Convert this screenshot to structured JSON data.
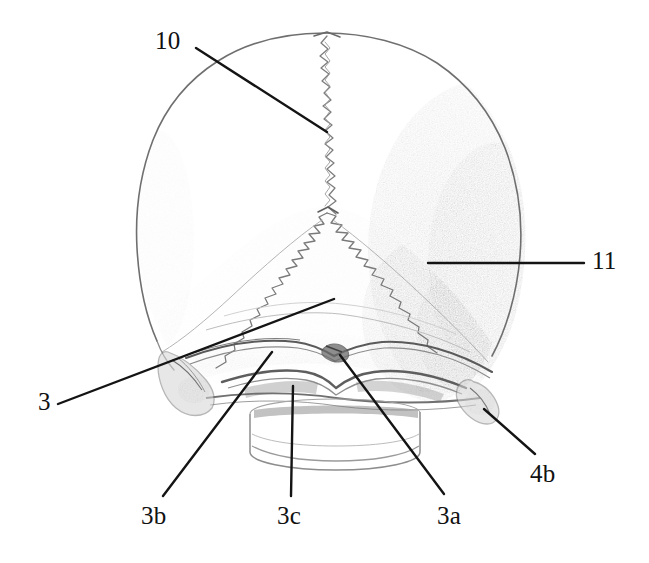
{
  "figure": {
    "medium": "pencil drawing",
    "background_color": "#ffffff",
    "ink_color": "#1a1a1a",
    "pencil_color": "#8a8a8a",
    "view": "posterior"
  },
  "labels": [
    {
      "id": "10",
      "text": "10",
      "structure": "sagittal suture",
      "text_x": 155,
      "text_y": 28,
      "leader": {
        "x1": 196,
        "y1": 48,
        "x2": 327,
        "y2": 132
      }
    },
    {
      "id": "11",
      "text": "11",
      "structure": "lambdoid suture",
      "text_x": 592,
      "text_y": 248,
      "leader": {
        "x1": 584,
        "y1": 263,
        "x2": 428,
        "y2": 263
      }
    },
    {
      "id": "3",
      "text": "3",
      "structure": "occipital bone",
      "text_x": 38,
      "text_y": 389,
      "leader": {
        "x1": 58,
        "y1": 404,
        "x2": 334,
        "y2": 299
      }
    },
    {
      "id": "3b",
      "text": "3b",
      "structure": "superior nuchal line",
      "text_x": 141,
      "text_y": 503,
      "leader": {
        "x1": 163,
        "y1": 496,
        "x2": 272,
        "y2": 352
      }
    },
    {
      "id": "3c",
      "text": "3c",
      "structure": "inferior nuchal line",
      "text_x": 277,
      "text_y": 503,
      "leader": {
        "x1": 291,
        "y1": 496,
        "x2": 293,
        "y2": 386
      }
    },
    {
      "id": "3a",
      "text": "3a",
      "structure": "external occipital protuberance",
      "text_x": 437,
      "text_y": 503,
      "leader": {
        "x1": 444,
        "y1": 494,
        "x2": 340,
        "y2": 355
      }
    },
    {
      "id": "4b",
      "text": "4b",
      "structure": "mastoid process",
      "text_x": 530,
      "text_y": 461,
      "leader": {
        "x1": 535,
        "y1": 454,
        "x2": 484,
        "y2": 409
      }
    }
  ],
  "structures": [
    {
      "key": "cranial-vault",
      "name": "cranial vault outline"
    },
    {
      "key": "sagittal-suture",
      "name": "sagittal suture"
    },
    {
      "key": "lambdoid-suture",
      "name": "lambdoid suture"
    },
    {
      "key": "occipital-bone",
      "name": "occipital squama"
    },
    {
      "key": "superior-nuchal-line",
      "name": "superior nuchal line"
    },
    {
      "key": "inferior-nuchal-line",
      "name": "inferior nuchal line"
    },
    {
      "key": "external-occipital-protuberance",
      "name": "external occipital protuberance"
    },
    {
      "key": "mastoid-process-left",
      "name": "left mastoid process"
    },
    {
      "key": "mastoid-process-right",
      "name": "right mastoid process"
    },
    {
      "key": "vertebral-stub",
      "name": "cervical vertebra stub"
    },
    {
      "key": "shading-right",
      "name": "right lateral pencil shading"
    }
  ]
}
